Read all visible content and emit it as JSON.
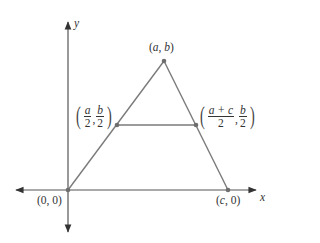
{
  "diagram": {
    "axes": {
      "x_label": "x",
      "y_label": "y"
    },
    "vertices": [
      {
        "id": "origin",
        "label": "(0, 0)",
        "parts": {
          "open": "(",
          "a": "0",
          "sep": ", ",
          "b": "0",
          "close": ")"
        }
      },
      {
        "id": "apex",
        "label": "(a, b)",
        "parts": {
          "open": "(",
          "a": "a",
          "sep": ", ",
          "b": "b",
          "close": ")"
        }
      },
      {
        "id": "right",
        "label": "(c, 0)",
        "parts": {
          "open": "(",
          "a": "c",
          "sep": ", ",
          "b": "0",
          "close": ")"
        }
      }
    ],
    "midpoints": [
      {
        "id": "left-mid",
        "label": "(a/2, b/2)",
        "x_num": "a",
        "x_den": "2",
        "sep": ",",
        "y_num": "b",
        "y_den": "2"
      },
      {
        "id": "right-mid",
        "label": "((a + c)/2, b/2)",
        "x_num": "a + c",
        "x_den": "2",
        "sep": ",",
        "y_num": "b",
        "y_den": "2"
      }
    ],
    "colors": {
      "line": "#7a7a7a",
      "point": "#6e6e6e",
      "axis": "#555555",
      "text": "#333333"
    }
  }
}
